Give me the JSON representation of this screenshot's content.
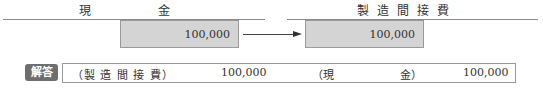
{
  "diagram": {
    "left_account": {
      "title_chars": [
        "現",
        "金"
      ],
      "credit_amount": "100,000"
    },
    "right_account": {
      "title_chars": [
        "製",
        "造",
        "間",
        "接",
        "費"
      ],
      "debit_amount": "100,000"
    },
    "arrow": "right-arrow"
  },
  "answer": {
    "badge_label": "解答",
    "debit_account": "（製 造 間 接 費）",
    "debit_amount": "100,000",
    "credit_account_open": "（現",
    "credit_account_close": "金）",
    "credit_amount": "100,000"
  }
}
